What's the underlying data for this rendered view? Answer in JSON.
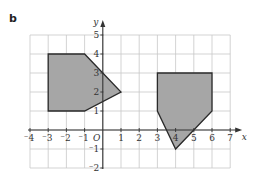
{
  "part_label": "b",
  "colors": {
    "grid": "#c8c8c8",
    "axis": "#333333",
    "shape_fill": "#a6a6a6",
    "shape_stroke": "#2a2a2a",
    "text": "#333333"
  },
  "axes": {
    "x_label": "x",
    "y_label": "y",
    "origin_label": "O",
    "x_range": [
      -4,
      7
    ],
    "y_range": [
      -2,
      5
    ],
    "x_ticks": [
      "-4",
      "-3",
      "-2",
      "-1",
      "1",
      "2",
      "3",
      "4",
      "5",
      "6",
      "7"
    ],
    "y_ticks": [
      "-2",
      "-1",
      "1",
      "2",
      "3",
      "4",
      "5"
    ]
  },
  "chart_data": {
    "type": "diagram",
    "title": "",
    "grid": true,
    "xlim": [
      -4,
      7
    ],
    "ylim": [
      -2,
      5
    ],
    "xlabel": "x",
    "ylabel": "y",
    "shapes": [
      {
        "name": "shape-A",
        "vertices": [
          [
            -3,
            1
          ],
          [
            -3,
            4
          ],
          [
            -1,
            4
          ],
          [
            1,
            2
          ],
          [
            -1,
            1
          ]
        ]
      },
      {
        "name": "shape-B",
        "vertices": [
          [
            3,
            3
          ],
          [
            6,
            3
          ],
          [
            6,
            1
          ],
          [
            4,
            -1
          ],
          [
            3,
            1
          ]
        ]
      }
    ]
  }
}
